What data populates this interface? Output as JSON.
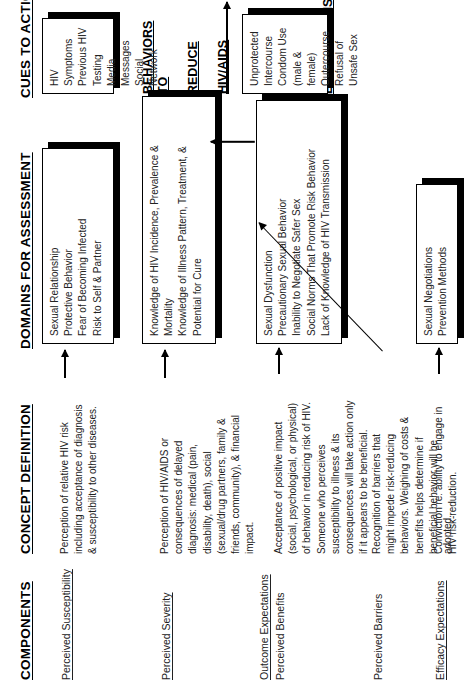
{
  "diagram": {
    "columns": [
      {
        "id": "components",
        "label": "COMPONENTS"
      },
      {
        "id": "concept_definition",
        "label": "CONCEPT DEFINITION"
      },
      {
        "id": "domains",
        "label": "DOMAINS FOR ASSESSMENT"
      },
      {
        "id": "cues",
        "label": "CUES TO ACTION"
      }
    ],
    "headline": {
      "line1": "BEHAVIORS TO",
      "line2": "REDUCE",
      "line3": "HIV/AIDS",
      "line4": "THREAT BASED",
      "line5": "ON",
      "line6": "EXPECTATIONS"
    },
    "rows": [
      {
        "id": "perceived-susceptibility",
        "component": "Perceived Susceptibility",
        "component_underlined": true,
        "group_label": null,
        "definition": "Perception of relative HIV risk\nincluding acceptance of  diagnosis\n& susceptibility to other diseases.",
        "domain_box": "Sexual Relationship\nProtective Behavior\nFear of Becoming Infected\nRisk to Self & Partner"
      },
      {
        "id": "perceived-severity",
        "component": "Perceived Severity",
        "component_underlined": true,
        "group_label": null,
        "definition": "Perception of HIV/AIDS or\nconsequences of delayed\ndiagnosis: medical (pain,\ndisability, death), social\n(sexual/drug partners, family &\nfriends, community), & financial\nimpact.",
        "domain_box": "Knowledge of HIV Incidence, Prevalence &\n   Mortality\nKnowledge of Illness Pattern, Treatment, &\n   Potential for Cure"
      },
      {
        "id": "perceived-benefits",
        "component": "Perceived Benefits",
        "component_underlined": false,
        "group_label": "Outcome Expectations",
        "definition": "Acceptance of positive impact\n(social, psychological, or physical)\nof behavior in reducing risk of HIV.\nSomeone who perceives\nsusceptibility to illness & its\nconsequences will take action only\nif it appears to be beneficial.",
        "domain_box": "Sexual Dysfunction\nPrecautionary Sexual Behavior\nInability to Negotiate Safer Sex\nSocial Norms That Promote Risk Behavior\nLack of Knowledge of HIV Transmission"
      },
      {
        "id": "perceived-barriers",
        "component": "Perceived Barriers",
        "component_underlined": false,
        "group_label": null,
        "definition": "Recognition of barriers that\nmight impede risk-reducing\nbehaviors.  Weighing of costs &\nbenefits helps determine if\nbeneficial behavior will be\nadopted.",
        "domain_box": null
      },
      {
        "id": "efficacy-expectations",
        "component": "Efficacy Expectations",
        "component_underlined": true,
        "group_label": null,
        "definition": "Conviction re: ability to engage in\nHIV risk-reduction.",
        "domain_box": "Sexual Negotiations\nPrevention Methods"
      }
    ],
    "cues_box": "HIV Symptoms\nPrevious HIV Testing\nMedia Messages\nSocial Network",
    "behaviors_box": "Unprotected\n   Intercourse\nCondom Use (male &\n   female)\nOutercourse\nRefusal of Unsafe Sex"
  }
}
